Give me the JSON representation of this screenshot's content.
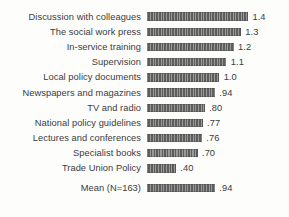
{
  "chart_data": {
    "type": "bar",
    "orientation": "horizontal",
    "title": "",
    "subtitle": "",
    "xlabel": "",
    "ylabel": "",
    "grid": false,
    "legend": null,
    "xlim": [
      0,
      1.4
    ],
    "categories": [
      "Discussion with colleagues",
      "The social work press",
      "In-service training",
      "Supervision",
      "Local policy documents",
      "Newspapers and magazines",
      "TV and radio",
      "National policy guidelines",
      "Lectures and conferences",
      "Specialist books",
      "Trade Union Policy",
      "Mean (N=163)"
    ],
    "values": [
      1.4,
      1.3,
      1.2,
      1.1,
      1.0,
      0.94,
      0.8,
      0.77,
      0.76,
      0.7,
      0.4,
      0.94
    ],
    "value_labels": [
      "1.4",
      "1.3",
      "1.2",
      "1.1",
      "1.0",
      ".94",
      ".80",
      ".77",
      ".76",
      ".70",
      ".40",
      ".94"
    ],
    "bar_color": "#6f6f6f",
    "text_color": "#3b3b3b",
    "background_color": "#fdfdfc",
    "summary_row_index": 11
  }
}
